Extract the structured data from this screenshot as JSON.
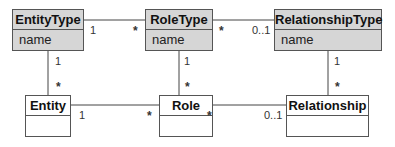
{
  "diagram": {
    "type": "UML class diagram",
    "classes": [
      {
        "id": "entity_type",
        "name": "EntityType",
        "attributes": [
          "name"
        ],
        "shaded": true
      },
      {
        "id": "role_type",
        "name": "RoleType",
        "attributes": [
          "name"
        ],
        "shaded": true
      },
      {
        "id": "relationship_type",
        "name": "RelationshipType",
        "attributes": [
          "name"
        ],
        "shaded": true
      },
      {
        "id": "entity",
        "name": "Entity",
        "attributes": [],
        "shaded": false
      },
      {
        "id": "role",
        "name": "Role",
        "attributes": [],
        "shaded": false
      },
      {
        "id": "relationship",
        "name": "Relationship",
        "attributes": [],
        "shaded": false
      }
    ],
    "associations": [
      {
        "from": "EntityType",
        "to": "RoleType",
        "from_mult": "1",
        "to_mult": "*"
      },
      {
        "from": "RoleType",
        "to": "RelationshipType",
        "from_mult": "*",
        "to_mult": "0..1"
      },
      {
        "from": "EntityType",
        "to": "Entity",
        "from_mult": "1",
        "to_mult": "*"
      },
      {
        "from": "RoleType",
        "to": "Role",
        "from_mult": "1",
        "to_mult": "*"
      },
      {
        "from": "RelationshipType",
        "to": "Relationship",
        "from_mult": "1",
        "to_mult": "*"
      },
      {
        "from": "Entity",
        "to": "Role",
        "from_mult": "1",
        "to_mult": "*"
      },
      {
        "from": "Role",
        "to": "Relationship",
        "from_mult": "*",
        "to_mult": "0..1"
      }
    ]
  },
  "labels": {
    "entity_type": "EntityType",
    "role_type": "RoleType",
    "relationship_type": "RelationshipType",
    "entity": "Entity",
    "role": "Role",
    "relationship": "Relationship",
    "attr_name": "name"
  },
  "mult": {
    "one": "1",
    "many": "*",
    "zero_one": "0..1"
  }
}
